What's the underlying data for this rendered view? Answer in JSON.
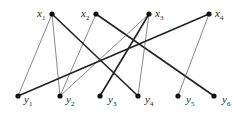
{
  "diagram": {
    "type": "bipartite-graph",
    "colors": {
      "node": "#111111",
      "thin_edge": "#555555",
      "thick_edge": "#222222",
      "label": "#222222"
    },
    "top_nodes": [
      {
        "id": "x1",
        "base": "x",
        "sub": "1",
        "cx": 52,
        "cy": 14,
        "lx": 37,
        "ly": 17
      },
      {
        "id": "x2",
        "base": "x",
        "sub": "2",
        "cx": 96,
        "cy": 14,
        "lx": 81,
        "ly": 17
      },
      {
        "id": "x3",
        "base": "x",
        "sub": "3",
        "cx": 149,
        "cy": 14,
        "lx": 155,
        "ly": 17
      },
      {
        "id": "x4",
        "base": "x",
        "sub": "4",
        "cx": 209,
        "cy": 14,
        "lx": 215,
        "ly": 17
      }
    ],
    "bottom_nodes": [
      {
        "id": "y1",
        "base": "y",
        "sub": "1",
        "cx": 18,
        "cy": 96,
        "lx": 24,
        "ly": 103
      },
      {
        "id": "y2",
        "base": "y",
        "sub": "2",
        "cx": 60,
        "cy": 96,
        "lx": 66,
        "ly": 103
      },
      {
        "id": "y3",
        "base": "y",
        "sub": "3",
        "cx": 100,
        "cy": 96,
        "lx": 108,
        "ly": 103
      },
      {
        "id": "y4",
        "base": "y",
        "sub": "4",
        "cx": 138,
        "cy": 96,
        "lx": 145,
        "ly": 103
      },
      {
        "id": "y5",
        "base": "y",
        "sub": "5",
        "cx": 178,
        "cy": 96,
        "lx": 186,
        "ly": 103
      },
      {
        "id": "y6",
        "base": "y",
        "sub": "6",
        "cx": 214,
        "cy": 96,
        "lx": 222,
        "ly": 103
      }
    ],
    "edges": [
      {
        "from": "x1",
        "to": "y1",
        "weight": "thin"
      },
      {
        "from": "x1",
        "to": "y2",
        "weight": "thin"
      },
      {
        "from": "x1",
        "to": "y4",
        "weight": "thick"
      },
      {
        "from": "x2",
        "to": "y2",
        "weight": "thin"
      },
      {
        "from": "x2",
        "to": "y6",
        "weight": "thick"
      },
      {
        "from": "x3",
        "to": "y2",
        "weight": "thin"
      },
      {
        "from": "x3",
        "to": "y3",
        "weight": "thick"
      },
      {
        "from": "x3",
        "to": "y4",
        "weight": "thin"
      },
      {
        "from": "x4",
        "to": "y1",
        "weight": "thick"
      },
      {
        "from": "x4",
        "to": "y5",
        "weight": "thin"
      }
    ]
  }
}
